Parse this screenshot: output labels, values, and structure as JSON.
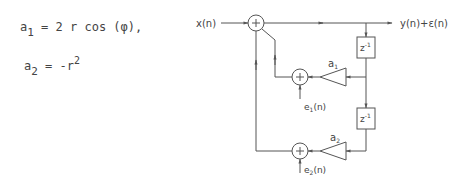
{
  "equations": {
    "a1": {
      "lhs": "a",
      "lhs_sub": "1",
      "rhs": "= 2 r cos (φ),",
      "rhs_sup": ""
    },
    "a2": {
      "lhs": "a",
      "lhs_sub": "2",
      "rhs": "= -r",
      "rhs_sup": "2"
    }
  },
  "diagram": {
    "input_label": "x(n)",
    "output_label": "y(n)+ε(n)",
    "delay_label": "z",
    "delay_exp": "-1",
    "coef1_label": "a",
    "coef1_sub": "1",
    "coef2_label": "a",
    "coef2_sub": "2",
    "error1_label": "e",
    "error1_sub": "1",
    "error1_arg": "(n)",
    "error2_label": "e",
    "error2_sub": "2",
    "error2_arg": "(n)",
    "adder_symbol": "+",
    "line_color": "#555555"
  }
}
